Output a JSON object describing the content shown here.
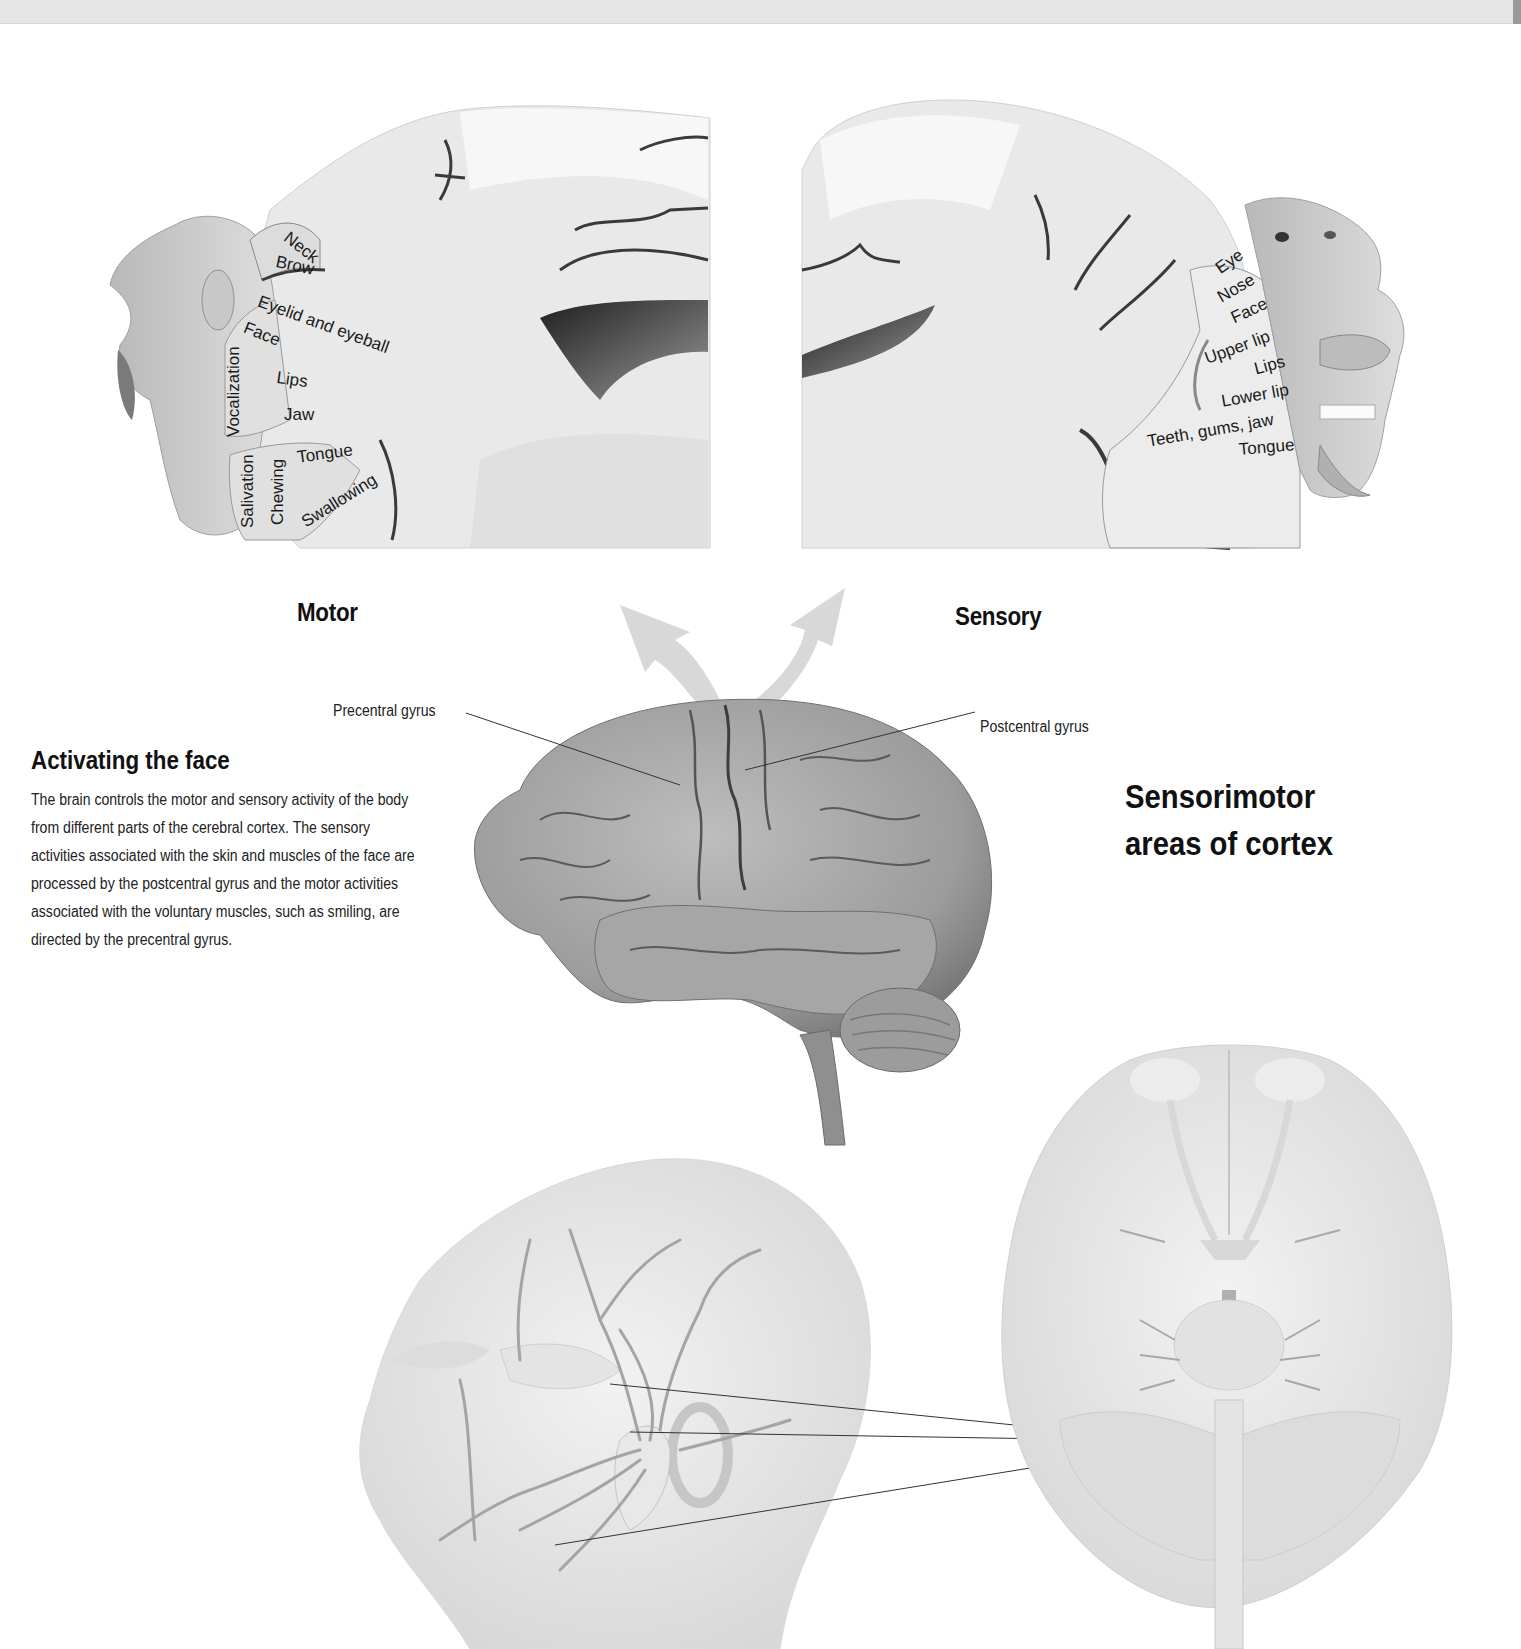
{
  "colors": {
    "background": "#ffffff",
    "top_band": "#e6e6e6",
    "tissue_light": "#eeeeee",
    "tissue_mid": "#cfcfcf",
    "tissue_dark": "#8a8a8a",
    "sulcus": "#3a3a3a",
    "arrow": "#d4d4d4",
    "text": "#111111"
  },
  "motor_panel": {
    "label": "Motor",
    "regions": [
      {
        "id": "neck",
        "text": "Neck"
      },
      {
        "id": "brow",
        "text": "Brow"
      },
      {
        "id": "eyelid",
        "text": "Eyelid and eyeball"
      },
      {
        "id": "face",
        "text": "Face"
      },
      {
        "id": "vocalization",
        "text": "Vocalization"
      },
      {
        "id": "lips",
        "text": "Lips"
      },
      {
        "id": "jaw",
        "text": "Jaw"
      },
      {
        "id": "tongue",
        "text": "Tongue"
      },
      {
        "id": "salivation",
        "text": "Salivation"
      },
      {
        "id": "chewing",
        "text": "Chewing"
      },
      {
        "id": "swallowing",
        "text": "Swallowing"
      }
    ]
  },
  "sensory_panel": {
    "label": "Sensory",
    "regions": [
      {
        "id": "eye",
        "text": "Eye"
      },
      {
        "id": "nose",
        "text": "Nose"
      },
      {
        "id": "face",
        "text": "Face"
      },
      {
        "id": "upper_lip",
        "text": "Upper lip"
      },
      {
        "id": "lips",
        "text": "Lips"
      },
      {
        "id": "lower_lip",
        "text": "Lower lip"
      },
      {
        "id": "teeth",
        "text": "Teeth, gums, jaw"
      },
      {
        "id": "tongue",
        "text": "Tongue"
      }
    ]
  },
  "brain_callouts": {
    "precentral": "Precentral gyrus",
    "postcentral": "Postcentral gyrus"
  },
  "intro": {
    "title": "Activating the face",
    "body": "The brain controls the motor and sensory activity of the body from different parts of the cerebral cortex. The sensory activities associated with the skin and muscles of the face are processed by the postcentral gyrus and the motor activities associated with the voluntary muscles, such as smiling, are directed by the precentral gyrus."
  },
  "side_heading": {
    "line1": "Sensorimotor",
    "line2": "areas of cortex"
  },
  "illustrations": {
    "motor_section": "coronal-section-motor-homunculus",
    "sensory_section": "coronal-section-sensory-homunculus",
    "lateral_brain": "lateral-view-brain",
    "facial_nerves": "head-facial-nerve-branches",
    "brain_underside": "inferior-view-brain-cranial-nerves"
  }
}
